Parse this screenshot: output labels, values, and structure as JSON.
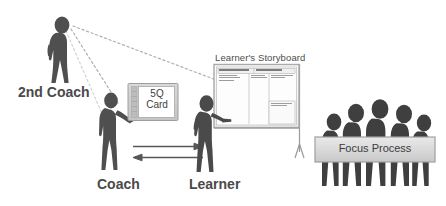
{
  "diagram": {
    "title_visible": false,
    "labels": {
      "second_coach": "2nd Coach",
      "coach": "Coach",
      "learner": "Learner"
    },
    "card": {
      "line1": "5Q",
      "line2": "Card"
    },
    "storyboard": {
      "title": "Learner's Storyboard",
      "header_sections": [
        "Focus Process",
        "Challenge"
      ],
      "columns": [
        "Target Condition",
        "Current Condition",
        "Obstacles / Experiments Record"
      ],
      "lower_right_block": "Obstacles Parking Lot"
    },
    "focus_process": {
      "label": "Focus Process"
    },
    "arrows": {
      "coach_to_learner": "right",
      "learner_to_coach": "left"
    },
    "sight_lines": {
      "style": "dotted",
      "from": "second-coach",
      "to": [
        "coach",
        "learner"
      ]
    },
    "team": {
      "figure_count": 5
    }
  },
  "colors": {
    "figure_dark": "#4a4a4a",
    "figure_mid": "#5a5a5a",
    "board_fill": "#f2f2f2",
    "board_frame": "#b9b9b9",
    "panel_fill": "#d6d6d6",
    "text": "#4a4a4a",
    "background": "#ffffff",
    "line": "#555555"
  }
}
